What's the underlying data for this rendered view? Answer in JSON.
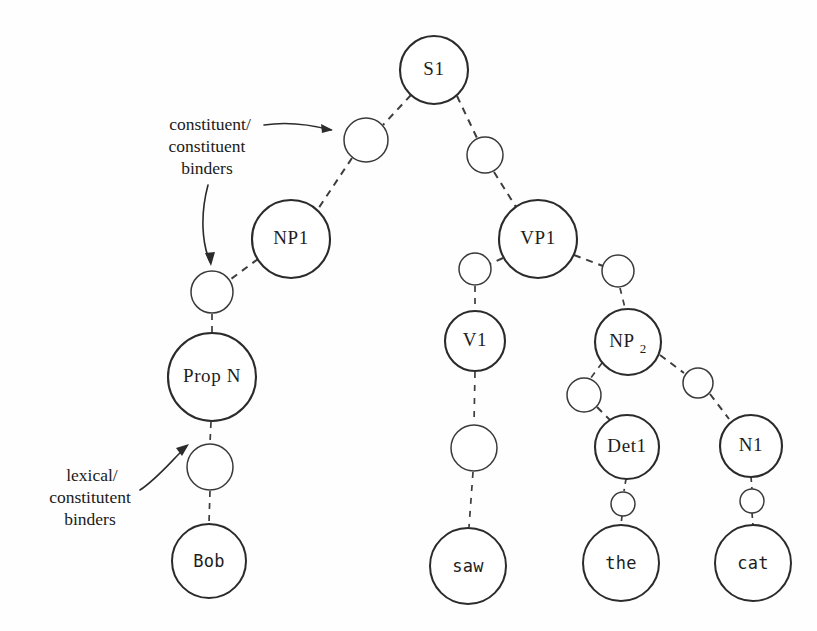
{
  "diagram": {
    "ink_color": "#2b2b2b",
    "background_color": "#ffffff",
    "annotations": [
      {
        "id": "constituent-constituent",
        "lines": [
          "constituent/",
          "constituent",
          "binders"
        ],
        "line1": "constituent/",
        "line2": "constituent",
        "line3": "binders"
      },
      {
        "id": "lexical-constituent",
        "lines": [
          "lexical/",
          "constitutent",
          "binders"
        ],
        "line1": "lexical/",
        "line2": "constitutent",
        "line3": "binders"
      }
    ],
    "nodes": {
      "s1": {
        "label": "S1",
        "cx": 434,
        "cy": 70,
        "r": 34,
        "kind": "category"
      },
      "b_s1_np1": {
        "label": "",
        "cx": 366,
        "cy": 140,
        "r": 22,
        "kind": "binder"
      },
      "b_s1_vp1": {
        "label": "",
        "cx": 485,
        "cy": 155,
        "r": 18,
        "kind": "binder"
      },
      "np1": {
        "label": "NP1",
        "cx": 291,
        "cy": 239,
        "r": 39,
        "kind": "category"
      },
      "vp1": {
        "label": "VP1",
        "cx": 538,
        "cy": 239,
        "r": 39,
        "kind": "category"
      },
      "b_np1_propn": {
        "label": "",
        "cx": 212,
        "cy": 292,
        "r": 21,
        "kind": "binder"
      },
      "propn": {
        "label": "Prop N",
        "cx": 212,
        "cy": 377,
        "r": 44,
        "kind": "category"
      },
      "b_propn_bob": {
        "label": "",
        "cx": 210,
        "cy": 467,
        "r": 23,
        "kind": "binder"
      },
      "bob": {
        "label": "Bob",
        "cx": 209,
        "cy": 561,
        "r": 37,
        "kind": "leaf"
      },
      "b_vp1_v1": {
        "label": "",
        "cx": 475,
        "cy": 269,
        "r": 16,
        "kind": "binder"
      },
      "v1": {
        "label": "V1",
        "cx": 475,
        "cy": 341,
        "r": 30,
        "kind": "category"
      },
      "b_v1_saw": {
        "label": "",
        "cx": 474,
        "cy": 448,
        "r": 23,
        "kind": "binder"
      },
      "saw": {
        "label": "saw",
        "cx": 468,
        "cy": 566,
        "r": 38,
        "kind": "leaf"
      },
      "b_vp1_np2": {
        "label": "",
        "cx": 618,
        "cy": 271,
        "r": 16,
        "kind": "binder"
      },
      "np2": {
        "label": "NP",
        "sublabel": "2",
        "cx": 628,
        "cy": 342,
        "r": 33,
        "kind": "category"
      },
      "b_np2_det1": {
        "label": "",
        "cx": 584,
        "cy": 395,
        "r": 17,
        "kind": "binder"
      },
      "det1": {
        "label": "Det1",
        "cx": 627,
        "cy": 447,
        "r": 32,
        "kind": "category"
      },
      "b_det1_the": {
        "label": "",
        "cx": 623,
        "cy": 504,
        "r": 12,
        "kind": "binder"
      },
      "the": {
        "label": "the",
        "cx": 621,
        "cy": 563,
        "r": 38,
        "kind": "leaf"
      },
      "b_np2_n1": {
        "label": "",
        "cx": 698,
        "cy": 383,
        "r": 15,
        "kind": "binder"
      },
      "n1": {
        "label": "N1",
        "cx": 751,
        "cy": 446,
        "r": 31,
        "kind": "category"
      },
      "b_n1_cat": {
        "label": "",
        "cx": 752,
        "cy": 501,
        "r": 12,
        "kind": "binder"
      },
      "cat": {
        "label": "cat",
        "cx": 753,
        "cy": 563,
        "r": 38,
        "kind": "leaf"
      }
    },
    "edges": [
      {
        "from": "s1",
        "to": "b_s1_np1"
      },
      {
        "from": "b_s1_np1",
        "to": "np1"
      },
      {
        "from": "s1",
        "to": "b_s1_vp1"
      },
      {
        "from": "b_s1_vp1",
        "to": "vp1"
      },
      {
        "from": "np1",
        "to": "b_np1_propn"
      },
      {
        "from": "b_np1_propn",
        "to": "propn"
      },
      {
        "from": "propn",
        "to": "b_propn_bob"
      },
      {
        "from": "b_propn_bob",
        "to": "bob"
      },
      {
        "from": "vp1",
        "to": "b_vp1_v1"
      },
      {
        "from": "b_vp1_v1",
        "to": "v1"
      },
      {
        "from": "v1",
        "to": "b_v1_saw"
      },
      {
        "from": "b_v1_saw",
        "to": "saw"
      },
      {
        "from": "vp1",
        "to": "b_vp1_np2"
      },
      {
        "from": "b_vp1_np2",
        "to": "np2"
      },
      {
        "from": "np2",
        "to": "b_np2_det1"
      },
      {
        "from": "b_np2_det1",
        "to": "det1"
      },
      {
        "from": "det1",
        "to": "b_det1_the"
      },
      {
        "from": "b_det1_the",
        "to": "the"
      },
      {
        "from": "np2",
        "to": "b_np2_n1"
      },
      {
        "from": "b_np2_n1",
        "to": "n1"
      },
      {
        "from": "n1",
        "to": "b_n1_cat"
      },
      {
        "from": "b_n1_cat",
        "to": "cat"
      }
    ]
  }
}
